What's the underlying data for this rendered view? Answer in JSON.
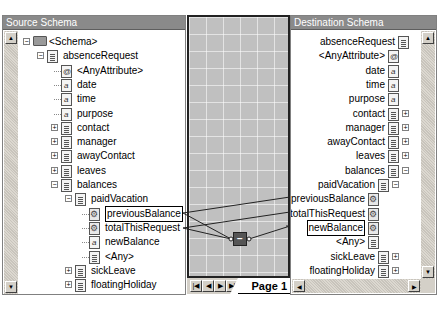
{
  "source_panel": {
    "title": "Source Schema",
    "tree": [
      {
        "label": "<Schema>",
        "level": 0,
        "type": "folder",
        "expander": "-"
      },
      {
        "label": "absenceRequest",
        "level": 1,
        "type": "record",
        "expander": "-"
      },
      {
        "label": "<AnyAttribute>",
        "level": 2,
        "type": "attribute",
        "expander": ""
      },
      {
        "label": "date",
        "level": 2,
        "type": "field",
        "expander": ""
      },
      {
        "label": "time",
        "level": 2,
        "type": "field",
        "expander": ""
      },
      {
        "label": "purpose",
        "level": 2,
        "type": "field",
        "expander": ""
      },
      {
        "label": "contact",
        "level": 2,
        "type": "record",
        "expander": "+"
      },
      {
        "label": "manager",
        "level": 2,
        "type": "record",
        "expander": "+"
      },
      {
        "label": "awayContact",
        "level": 2,
        "type": "record",
        "expander": "+"
      },
      {
        "label": "leaves",
        "level": 2,
        "type": "record",
        "expander": "+"
      },
      {
        "label": "balances",
        "level": 2,
        "type": "record",
        "expander": "-"
      },
      {
        "label": "paidVacation",
        "level": 3,
        "type": "record",
        "expander": "-"
      },
      {
        "label": "previousBalance",
        "level": 4,
        "type": "linked",
        "expander": "",
        "selected": true
      },
      {
        "label": "totalThisRequest",
        "level": 4,
        "type": "linked",
        "expander": ""
      },
      {
        "label": "newBalance",
        "level": 4,
        "type": "field",
        "expander": ""
      },
      {
        "label": "<Any>",
        "level": 4,
        "type": "record",
        "expander": ""
      },
      {
        "label": "sickLeave",
        "level": 3,
        "type": "record",
        "expander": "+"
      },
      {
        "label": "floatingHoliday",
        "level": 3,
        "type": "record",
        "expander": "+"
      }
    ]
  },
  "destination_panel": {
    "title": "Destination Schema",
    "tree": [
      {
        "label": "absenceRequest",
        "level": 0,
        "type": "record",
        "expander": ""
      },
      {
        "label": "<AnyAttribute>",
        "level": 1,
        "type": "attribute",
        "expander": ""
      },
      {
        "label": "date",
        "level": 1,
        "type": "field",
        "expander": ""
      },
      {
        "label": "time",
        "level": 1,
        "type": "field",
        "expander": ""
      },
      {
        "label": "purpose",
        "level": 1,
        "type": "field",
        "expander": ""
      },
      {
        "label": "contact",
        "level": 1,
        "type": "record",
        "expander": "+"
      },
      {
        "label": "manager",
        "level": 1,
        "type": "record",
        "expander": "+"
      },
      {
        "label": "awayContact",
        "level": 1,
        "type": "record",
        "expander": "+"
      },
      {
        "label": "leaves",
        "level": 1,
        "type": "record",
        "expander": "+"
      },
      {
        "label": "balances",
        "level": 1,
        "type": "record",
        "expander": "-"
      },
      {
        "label": "paidVacation",
        "level": 2,
        "type": "record",
        "expander": "-"
      },
      {
        "label": "previousBalance",
        "level": 3,
        "type": "linked",
        "expander": ""
      },
      {
        "label": "totalThisRequest",
        "level": 3,
        "type": "linked",
        "expander": ""
      },
      {
        "label": "newBalance",
        "level": 3,
        "type": "linked",
        "expander": "",
        "selected": true
      },
      {
        "label": "<Any>",
        "level": 3,
        "type": "record",
        "expander": ""
      },
      {
        "label": "sickLeave",
        "level": 2,
        "type": "record",
        "expander": "+"
      },
      {
        "label": "floatingHoliday",
        "level": 2,
        "type": "record",
        "expander": "+"
      }
    ]
  },
  "mapping_grid": {
    "functoid": {
      "name": "subtraction-functoid",
      "symbol": "−"
    },
    "page_tab": "Page 1",
    "nav_buttons": [
      "first-page",
      "previous-page",
      "next-page",
      "last-page"
    ],
    "nav_glyphs": [
      "|◀",
      "◀",
      "▶",
      "▶|"
    ]
  },
  "colors": {
    "title_bar": "#8a8a8a",
    "grid_background": "#c0c0c0",
    "functoid": "#555555",
    "link_line": "#222222"
  }
}
